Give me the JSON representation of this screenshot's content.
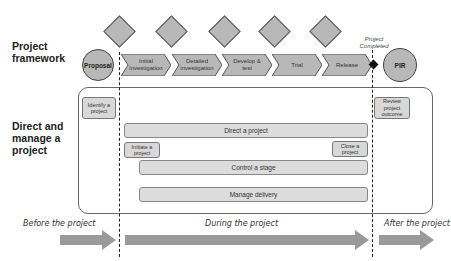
{
  "sections": {
    "framework": "Project framework",
    "direct_manage": "Direct and manage a project"
  },
  "framework": {
    "start": "Proposal",
    "stages": [
      "Initial investigation",
      "Detailed investigation",
      "Develop & test",
      "Trial",
      "Release"
    ],
    "end": "PIR",
    "milestone_note": "Project Completed",
    "gate_count": 5
  },
  "processes": {
    "identify": "Identify a project",
    "review": "Review project outcome",
    "direct": "Direct a project",
    "initiate": "Initiate a project",
    "close": "Close a project",
    "control": "Control a stage",
    "manage": "Manage delivery"
  },
  "phases": {
    "before": "Before the project",
    "during": "During the project",
    "after": "After the project"
  },
  "colors": {
    "shape_fill": "#b8b8b8",
    "box_fill": "#d8d8d8",
    "arrow_fill": "#9a9a9a",
    "line": "#444444"
  }
}
